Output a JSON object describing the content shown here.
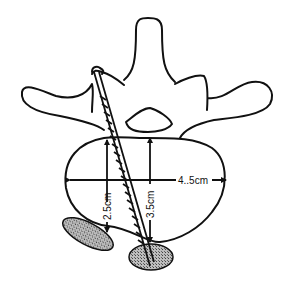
{
  "diagram": {
    "type": "anatomical-illustration",
    "colors": {
      "line": "#111111",
      "background": "#ffffff",
      "hatch_fill": "#9a9a9a"
    },
    "measurements": {
      "width_label": "4..5cm",
      "left_depth_label": "2.5cm",
      "right_depth_label": "3.5cm"
    },
    "elements": [
      {
        "name": "spinous-process",
        "label": ""
      },
      {
        "name": "transverse-process-left",
        "label": ""
      },
      {
        "name": "transverse-process-right",
        "label": ""
      },
      {
        "name": "spinal-canal",
        "label": ""
      },
      {
        "name": "vertebral-body",
        "label": ""
      },
      {
        "name": "screw-trajectory",
        "label": ""
      },
      {
        "name": "hatched-structure-left",
        "label": ""
      },
      {
        "name": "hatched-structure-right",
        "label": ""
      }
    ]
  }
}
